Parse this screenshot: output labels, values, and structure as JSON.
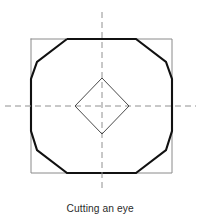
{
  "figure": {
    "caption": "Cutting an eye",
    "canvas": {
      "width": 201,
      "height": 224
    },
    "colors": {
      "background": "#ffffff",
      "polygon_stroke": "#111111",
      "square_stroke": "#8a8a8a",
      "diamond_stroke": "#4a4a4a",
      "centerline_stroke": "#909090",
      "caption_text": "#2b2b2b"
    },
    "stroke_widths": {
      "polygon": 2.1,
      "square": 1,
      "diamond": 1,
      "centerline": 1
    }
  },
  "geometry": {
    "square": {
      "label": "stock-square-outline",
      "x": 31,
      "y": 39,
      "width": 141,
      "height": 134,
      "points": "31,39 172,39 172,173 31,173 31,39"
    },
    "polygon": {
      "label": "dodecagon-outline",
      "sides": 12,
      "points": "67,39 136,39 166,62 172,79 172,131 166,150 136,173 67,173 37,150 31,131 31,79 37,62 67,39"
    },
    "diamond": {
      "label": "eye-diamond",
      "center_x": 102,
      "center_y": 106,
      "half_width": 27,
      "half_height": 28,
      "points": "102,78 129,106 102,134 75,106 102,78"
    },
    "centerlines": {
      "vertical": {
        "x": 102,
        "y1": 12,
        "y2": 190
      },
      "horizontal": {
        "y": 106,
        "x1": 5,
        "x2": 196
      },
      "dash_pattern": "6,4"
    }
  }
}
